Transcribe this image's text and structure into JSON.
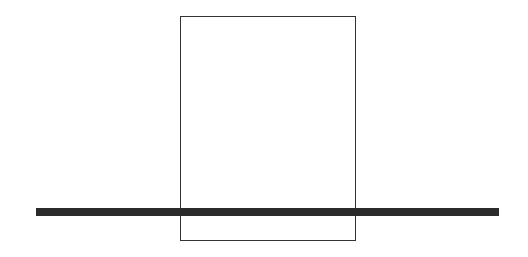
{
  "diagram": {
    "background": "#ffffff",
    "rectangle": {
      "x": 180,
      "y": 16,
      "width": 176,
      "height": 225,
      "stroke": "#333333",
      "stroke_width": 1
    },
    "bar": {
      "x": 36,
      "y": 208,
      "width": 463,
      "height": 8,
      "fill": "#2b2b2b"
    }
  }
}
